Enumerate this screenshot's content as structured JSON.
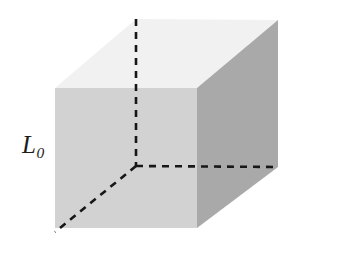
{
  "figure": {
    "kind": "3d-cube-diagram",
    "background_color": "#ffffff",
    "width": 348,
    "height": 255,
    "label": {
      "symbol": "L",
      "subscript": "0",
      "full_text": "L0",
      "color": "#1c1c1c",
      "position": {
        "x": 22,
        "y": 132
      }
    },
    "faces": {
      "top": {
        "name": "top-face",
        "color": "#f1f1f1",
        "points": "55,88 136,19 278,20 197,88"
      },
      "front": {
        "name": "front-face",
        "color": "#d2d2d2",
        "points": "55,88 197,88 197,228 55,228"
      },
      "right": {
        "name": "right-face",
        "color": "#a9a9a9",
        "points": "197,88 278,20 278,167 197,228"
      }
    },
    "hidden_edges": {
      "color": "#171717",
      "stroke_width": 2.6,
      "dash_pattern": "7,6",
      "vertical": {
        "name": "hidden-edge-vertical",
        "d": "M 136,19 L 136,166"
      },
      "horizontal": {
        "name": "hidden-edge-horizontal",
        "d": "M 136,166 L 278,167"
      },
      "diagonal": {
        "name": "hidden-edge-diagonal",
        "d": "M 136,166 L 55,232"
      }
    }
  },
  "chart_data": {
    "type": "diagram",
    "annotations": [
      {
        "text": "L0",
        "target": "left-vertical-edge",
        "meaning": "original edge length"
      }
    ],
    "vertices": {
      "front_top_left": [
        55,
        88
      ],
      "front_top_right": [
        197,
        88
      ],
      "front_bottom_left": [
        55,
        228
      ],
      "front_bottom_right": [
        197,
        228
      ],
      "back_top_left": [
        136,
        19
      ],
      "back_top_right": [
        278,
        20
      ],
      "back_bottom_right": [
        278,
        167
      ],
      "back_bottom_left": [
        136,
        166
      ],
      "hidden_corner": [
        55,
        232
      ]
    },
    "face_shades": {
      "top": "#f1f1f1",
      "front": "#d2d2d2",
      "right": "#a9a9a9"
    }
  }
}
